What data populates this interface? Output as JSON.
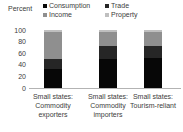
{
  "axis": {
    "title": "Percent",
    "ticks": [
      {
        "label": "100",
        "value": 100
      },
      {
        "label": "80",
        "value": 80
      },
      {
        "label": "60",
        "value": 60
      },
      {
        "label": "40",
        "value": 40
      },
      {
        "label": "20",
        "value": 20
      },
      {
        "label": "0",
        "value": 0
      }
    ]
  },
  "legend": {
    "items": [
      {
        "label": "Consumption",
        "color": "#070707"
      },
      {
        "label": "Trade",
        "color": "#262626"
      },
      {
        "label": "Income",
        "color": "#8f8f8f"
      },
      {
        "label": "Property",
        "color": "#bfbfbf"
      }
    ]
  },
  "chart_data": {
    "type": "bar",
    "stacked": true,
    "title": "",
    "xlabel": "",
    "ylabel": "Percent",
    "ylim": [
      0,
      100
    ],
    "grid": false,
    "legend_position": "top",
    "categories": [
      "Small states: Commodity exporters",
      "Small states: Commodity importers",
      "Small states: Tourism-reliant"
    ],
    "category_lines": [
      [
        "Small states:",
        "Commodity",
        "exporters"
      ],
      [
        "Small states:",
        "Commodity",
        "importers"
      ],
      [
        "Small states:",
        "Tourism-reliant"
      ]
    ],
    "series": [
      {
        "name": "Consumption",
        "color": "#070707",
        "values": [
          33,
          50,
          52
        ]
      },
      {
        "name": "Trade",
        "color": "#262626",
        "values": [
          17,
          22,
          20
        ]
      },
      {
        "name": "Income",
        "color": "#8f8f8f",
        "values": [
          46,
          24,
          24
        ]
      },
      {
        "name": "Property",
        "color": "#bfbfbf",
        "values": [
          4,
          4,
          4
        ]
      }
    ]
  },
  "colors": {
    "background": "#ffffff",
    "axis_line": "#b3b3b3",
    "text": "#3d3d3d"
  }
}
